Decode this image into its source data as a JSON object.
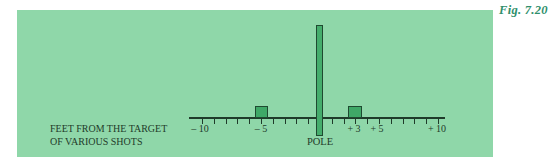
{
  "figure": {
    "label": "Fig. 7.20",
    "background_color": "#8fd7a9",
    "bar_color": "#3fa867",
    "line_color": "#1f3b2a"
  },
  "axis": {
    "caption_line1": "FEET FROM THE TARGET",
    "caption_line2": "OF VARIOUS SHOTS",
    "tick_labels": [
      {
        "value": -10,
        "text": "– 10"
      },
      {
        "value": -5,
        "text": "– 5"
      },
      {
        "value": 3,
        "text": "+ 3"
      },
      {
        "value": 5,
        "text": "+ 5"
      },
      {
        "value": 10,
        "text": "+ 10"
      }
    ],
    "pole_label": "POLE"
  },
  "chart_data": {
    "type": "bar",
    "title": "",
    "xlabel": "FEET FROM THE TARGET OF VARIOUS SHOTS",
    "ylabel": "",
    "x": [
      -5,
      0,
      3
    ],
    "categories": [
      "-5",
      "POLE (0)",
      "+3"
    ],
    "values": [
      1,
      8,
      1
    ],
    "xlim": [
      -11,
      11
    ],
    "xticks_labeled": [
      -10,
      -5,
      3,
      5,
      10
    ],
    "xticks_minor_step": 1,
    "annotations": [
      "POLE",
      "Fig. 7.20"
    ],
    "grid": false,
    "legend": null
  }
}
